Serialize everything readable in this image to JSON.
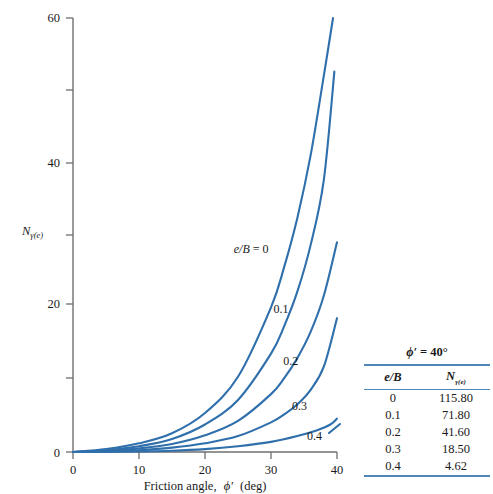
{
  "chart_data": {
    "type": "line",
    "title": "",
    "xlabel": "Friction angle, ϕ′ (deg)",
    "ylabel": "Nγ(e)",
    "xlim": [
      0,
      40
    ],
    "ylim": [
      0,
      60
    ],
    "xticks": [
      "0",
      "10",
      "20",
      "30",
      "40"
    ],
    "yticks": [
      "0",
      "20",
      "40",
      "60"
    ],
    "xtick_values": [
      0,
      10,
      20,
      30,
      40
    ],
    "ytick_values": [
      0,
      20,
      40,
      60
    ],
    "grid": false,
    "legend_position": "inline-curve-labels",
    "series": [
      {
        "name": "e/B = 0",
        "label": "e/B = 0",
        "x": [
          0,
          5,
          10,
          15,
          20,
          25,
          30,
          32,
          34,
          36,
          38,
          39.4
        ],
        "y": [
          0.0,
          0.4,
          1.2,
          2.6,
          5.4,
          10.4,
          20.0,
          25.6,
          32.4,
          41.0,
          52.0,
          60.0
        ]
      },
      {
        "name": "e/B = 0.1",
        "label": "0.1",
        "x": [
          0,
          5,
          10,
          15,
          20,
          25,
          30,
          32,
          34,
          36,
          38,
          39.6
        ],
        "y": [
          0.0,
          0.25,
          0.8,
          1.8,
          3.8,
          7.2,
          13.6,
          17.4,
          22.2,
          28.6,
          37.6,
          52.6
        ]
      },
      {
        "name": "e/B = 0.2",
        "label": "0.2",
        "x": [
          0,
          5,
          10,
          15,
          20,
          25,
          30,
          32,
          34,
          36,
          38,
          40
        ],
        "y": [
          0.0,
          0.15,
          0.5,
          1.1,
          2.3,
          4.3,
          8.0,
          10.2,
          13.0,
          16.6,
          21.6,
          29.0
        ]
      },
      {
        "name": "e/B = 0.3",
        "label": "0.3",
        "x": [
          0,
          5,
          10,
          15,
          20,
          25,
          30,
          32,
          34,
          36,
          38,
          40
        ],
        "y": [
          0.0,
          0.08,
          0.25,
          0.6,
          1.2,
          2.2,
          4.1,
          5.2,
          6.6,
          8.6,
          11.8,
          18.5
        ]
      },
      {
        "name": "e/B = 0.4",
        "label": "0.4",
        "x": [
          0,
          5,
          10,
          15,
          20,
          25,
          30,
          34,
          37,
          39,
          40
        ],
        "y": [
          0.0,
          0.02,
          0.08,
          0.18,
          0.4,
          0.8,
          1.4,
          2.2,
          3.0,
          3.8,
          4.62
        ]
      }
    ],
    "curve_labels": [
      {
        "text": "e/B = 0",
        "x": 27.0,
        "y": 27.5
      },
      {
        "text": "0.1",
        "x": 31.5,
        "y": 19.2
      },
      {
        "text": "0.2",
        "x": 33.0,
        "y": 12.0
      },
      {
        "text": "0.3",
        "x": 34.3,
        "y": 5.8
      },
      {
        "text": "0.4",
        "x": 36.6,
        "y": 1.6
      }
    ]
  },
  "table": {
    "title_symbol": "ϕ′",
    "title_rel": "=",
    "title_value": "40°",
    "title_full": "ϕ′ = 40°",
    "columns": [
      "e/B",
      "Nγ(e)"
    ],
    "col_a_header": "e/B",
    "col_b_header_main": "N",
    "col_b_header_sub": "γ(e)",
    "rows": [
      {
        "eB": "0",
        "ngamma": "115.80"
      },
      {
        "eB": "0.1",
        "ngamma": "71.80"
      },
      {
        "eB": "0.2",
        "ngamma": "41.60"
      },
      {
        "eB": "0.3",
        "ngamma": "18.50"
      },
      {
        "eB": "0.4",
        "ngamma": "4.62"
      }
    ]
  },
  "axes": {
    "x_title_prefix": "Friction angle,",
    "x_title_symbol": "ϕ′",
    "x_title_unit": "(deg)",
    "y_title_main": "N",
    "y_title_sub": "γ(e)"
  },
  "colors": {
    "curve": "#2f6fab",
    "axis": "#6f6f6f",
    "rule": "#4f86b8",
    "text": "#1a1a1a",
    "background": "#ffffff"
  }
}
